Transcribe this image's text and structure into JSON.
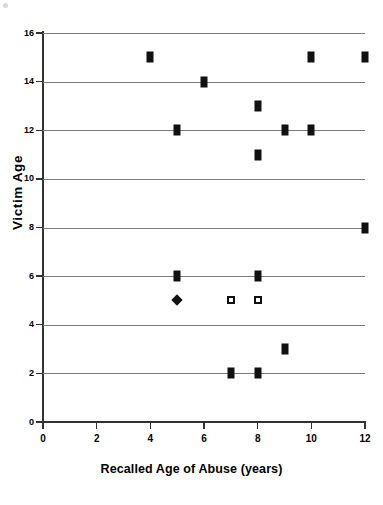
{
  "chart_data": {
    "type": "scatter",
    "title": "",
    "xlabel": "Recalled Age of Abuse (years)",
    "ylabel": "Victim Age",
    "xlim": [
      0,
      12
    ],
    "ylim": [
      0,
      16
    ],
    "xticks": [
      0,
      2,
      4,
      6,
      8,
      10,
      12
    ],
    "yticks": [
      0,
      2,
      4,
      6,
      8,
      10,
      12,
      14,
      16
    ],
    "grid": "horizontal",
    "legend": "none",
    "series": [
      {
        "name": "filled-square",
        "marker": "filled-square",
        "color": "#111111",
        "points": [
          {
            "x": 4,
            "y": 15
          },
          {
            "x": 10,
            "y": 15
          },
          {
            "x": 12,
            "y": 15
          },
          {
            "x": 6,
            "y": 14
          },
          {
            "x": 8,
            "y": 13
          },
          {
            "x": 5,
            "y": 12
          },
          {
            "x": 9,
            "y": 12
          },
          {
            "x": 10,
            "y": 12
          },
          {
            "x": 8,
            "y": 11
          },
          {
            "x": 12,
            "y": 8
          },
          {
            "x": 5,
            "y": 6
          },
          {
            "x": 8,
            "y": 6
          },
          {
            "x": 9,
            "y": 3
          },
          {
            "x": 7,
            "y": 2
          },
          {
            "x": 8,
            "y": 2
          }
        ]
      },
      {
        "name": "filled-diamond",
        "marker": "filled-diamond",
        "color": "#111111",
        "points": [
          {
            "x": 5,
            "y": 5
          }
        ]
      },
      {
        "name": "open-square",
        "marker": "open-square",
        "color": "#111111",
        "points": [
          {
            "x": 7,
            "y": 5
          },
          {
            "x": 8,
            "y": 5
          }
        ]
      }
    ]
  },
  "axes": {
    "y_tick_labels": [
      "16",
      "14",
      "12",
      "10",
      "8",
      "6",
      "4",
      "2",
      "0"
    ],
    "x_tick_labels": [
      "0",
      "2",
      "4",
      "6",
      "8",
      "10",
      "12"
    ],
    "y_title": "Victim Age",
    "x_title": "Recalled Age of Abuse (years)"
  },
  "colors": {
    "marker": "#111111",
    "gridline": "#7d7d7d",
    "axis": "#333333",
    "background": "#ffffff"
  }
}
